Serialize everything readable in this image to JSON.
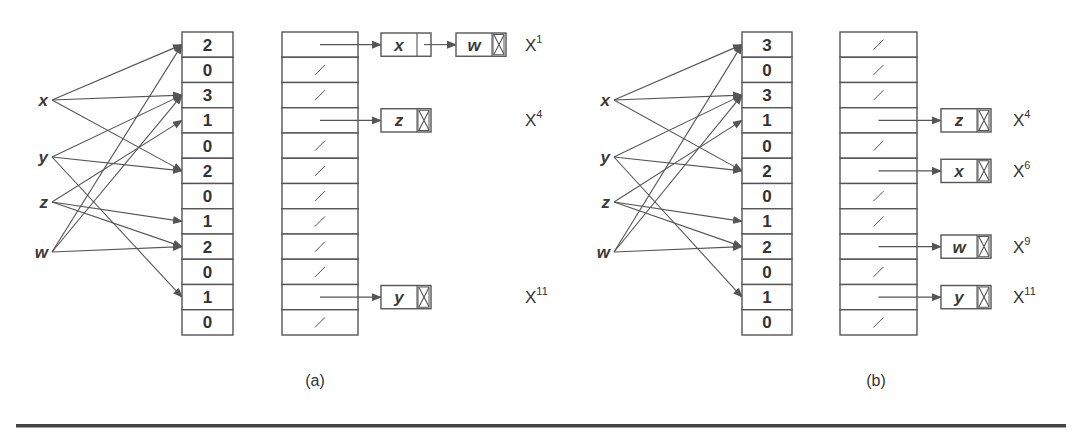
{
  "figure": {
    "panels": [
      {
        "caption": "(a)",
        "variables": [
          "x",
          "y",
          "z",
          "w"
        ],
        "edges": {
          "x": [
            0,
            2,
            5
          ],
          "y": [
            2,
            5,
            10
          ],
          "z": [
            3,
            7,
            8
          ],
          "w": [
            0,
            2,
            8
          ]
        },
        "counts": [
          "2",
          "0",
          "3",
          "1",
          "0",
          "2",
          "0",
          "1",
          "2",
          "0",
          "1",
          "0"
        ],
        "buckets": [
          {
            "row": 0,
            "chain": [
              "x",
              "w"
            ],
            "label": "X",
            "exp": "1"
          },
          {
            "row": 3,
            "chain": [
              "z"
            ],
            "label": "X",
            "exp": "4"
          },
          {
            "row": 10,
            "chain": [
              "y"
            ],
            "label": "X",
            "exp": "11"
          }
        ]
      },
      {
        "caption": "(b)",
        "variables": [
          "x",
          "y",
          "z",
          "w"
        ],
        "edges": {
          "x": [
            0,
            2,
            5
          ],
          "y": [
            2,
            5,
            10
          ],
          "z": [
            3,
            7,
            8
          ],
          "w": [
            0,
            2,
            8
          ]
        },
        "counts": [
          "3",
          "0",
          "3",
          "1",
          "0",
          "2",
          "0",
          "1",
          "2",
          "0",
          "1",
          "0"
        ],
        "buckets": [
          {
            "row": 3,
            "chain": [
              "z"
            ],
            "label": "X",
            "exp": "4"
          },
          {
            "row": 5,
            "chain": [
              "x"
            ],
            "label": "X",
            "exp": "6"
          },
          {
            "row": 8,
            "chain": [
              "w"
            ],
            "label": "X",
            "exp": "9"
          },
          {
            "row": 10,
            "chain": [
              "y"
            ],
            "label": "X",
            "exp": "11"
          }
        ]
      }
    ],
    "colors": {
      "line": "#555555",
      "text": "#333333",
      "rule": "#444444"
    }
  }
}
